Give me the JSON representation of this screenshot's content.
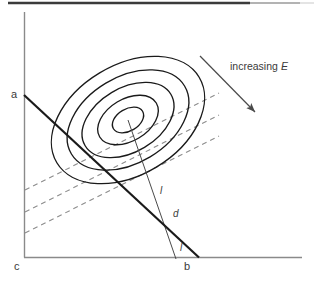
{
  "figure": {
    "type": "contour-ellipses-with-lines",
    "topRule": {
      "visible": true,
      "color": "#3b3b3b"
    },
    "axes": {
      "vertical": {
        "x": 24,
        "y1": 12,
        "y2": 258,
        "color": "#808080"
      },
      "horizontal": {
        "y": 257,
        "x1": 24,
        "x2": 302,
        "color": "#808080"
      }
    },
    "labels": {
      "a": "a",
      "b": "b",
      "c": "c",
      "d": "d",
      "l_upper": "l",
      "l_lower": "l",
      "increasing": "increasing",
      "energy_symbol": "E"
    },
    "contours": {
      "count": 5,
      "center": [
        128,
        120
      ],
      "rotation_deg": -31,
      "color": "#1a1a1a",
      "radii": [
        [
          83,
          55
        ],
        [
          66,
          43
        ],
        [
          50,
          32
        ],
        [
          33,
          21
        ],
        [
          17,
          11
        ]
      ]
    },
    "constraint_line": {
      "name": "line-ab",
      "from": [
        24,
        95
      ],
      "to": [
        199,
        257
      ],
      "color": "#1a1a1a",
      "width": 2.2
    },
    "gradient_line": {
      "name": "line-center-to-axis",
      "from": [
        128,
        120
      ],
      "to": [
        176,
        259
      ],
      "color": "#4a4a4a",
      "width": 1
    },
    "dashed_lines": {
      "count": 3,
      "color": "#8c8c8c",
      "dash": "5 4",
      "segments": [
        {
          "from": [
            25,
            190
          ],
          "to": [
            219,
            93
          ]
        },
        {
          "from": [
            25,
            212
          ],
          "to": [
            219,
            115
          ]
        },
        {
          "from": [
            25,
            233
          ],
          "to": [
            219,
            136
          ]
        }
      ]
    },
    "arrow": {
      "name": "increasing-E-arrow",
      "from": [
        200,
        56
      ],
      "to": [
        259,
        116
      ],
      "color": "#4a4a4a"
    }
  }
}
